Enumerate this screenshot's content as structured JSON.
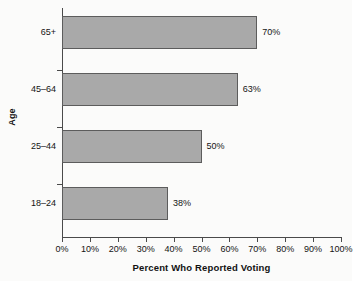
{
  "chart_data": {
    "type": "bar",
    "orientation": "horizontal",
    "title": "",
    "xlabel": "Percent Who Reported Voting",
    "ylabel": "Age",
    "categories": [
      "18–24",
      "25–44",
      "45–64",
      "65+"
    ],
    "values": [
      38,
      50,
      63,
      70
    ],
    "value_labels": [
      "38%",
      "50%",
      "63%",
      "70%"
    ],
    "xlim": [
      0,
      100
    ],
    "xticks": [
      0,
      10,
      20,
      30,
      40,
      50,
      60,
      70,
      80,
      90,
      100
    ],
    "xtick_labels": [
      "0%",
      "10%",
      "20%",
      "30%",
      "40%",
      "50%",
      "60%",
      "70%",
      "80%",
      "90%",
      "100%"
    ],
    "grid": false,
    "legend": null,
    "series": [
      {
        "name": "Percent Who Reported Voting",
        "values": [
          38,
          50,
          63,
          70
        ],
        "bar_color": "#a9a9a9",
        "bar_border_color": "#5c5c5c"
      }
    ],
    "colors": {
      "background": "#fbfbfa",
      "axis": "#4a4a4a",
      "text": "#141414",
      "bar_fill": "#a9a9a9",
      "bar_border": "#5c5c5c"
    }
  }
}
